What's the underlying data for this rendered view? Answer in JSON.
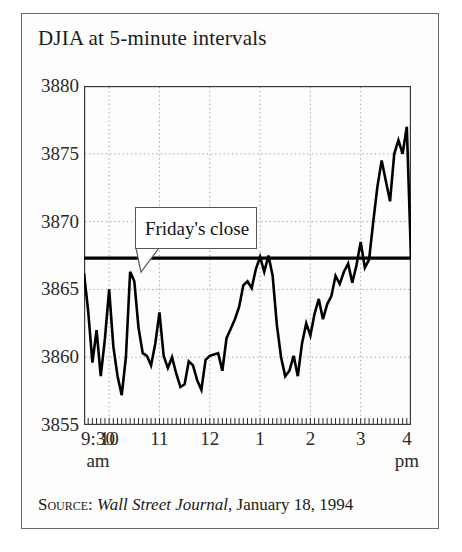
{
  "figure": {
    "title": "DJIA at 5-minute intervals",
    "source_label": "Source:",
    "source_publication": "Wall Street Journal",
    "source_date": ", January 18, 1994",
    "annotation": "Friday's close",
    "background_color": "#fdfdfb",
    "border_color": "#6b6b6b",
    "line_color": "#000000"
  },
  "chart_data": {
    "type": "line",
    "title": "DJIA at 5-minute intervals",
    "xlabel": "",
    "ylabel": "",
    "ylim": [
      3855,
      3880
    ],
    "xlim": [
      9.5,
      16.0
    ],
    "grid": true,
    "legend": "none",
    "ytick_labels": [
      "3880",
      "3875",
      "3870",
      "3865",
      "3860",
      "3855"
    ],
    "ytick_values": [
      3880,
      3875,
      3870,
      3865,
      3860,
      3855
    ],
    "xtick_labels": [
      "9:30",
      "10",
      "11",
      "12",
      "1",
      "2",
      "3",
      "4"
    ],
    "xtick_sublabels": [
      "am",
      "",
      "",
      "",
      "",
      "",
      "",
      "pm"
    ],
    "xtick_values": [
      9.5,
      10,
      11,
      12,
      13,
      14,
      15,
      16
    ],
    "reference_line": {
      "label": "Friday's close",
      "value": 3867.3
    },
    "series": [
      {
        "name": "DJIA",
        "x": [
          9.5,
          9.583,
          9.667,
          9.75,
          9.833,
          9.917,
          10.0,
          10.083,
          10.167,
          10.25,
          10.333,
          10.417,
          10.5,
          10.583,
          10.667,
          10.75,
          10.833,
          10.917,
          11.0,
          11.083,
          11.167,
          11.25,
          11.333,
          11.417,
          11.5,
          11.583,
          11.667,
          11.75,
          11.833,
          11.917,
          12.0,
          12.083,
          12.167,
          12.25,
          12.333,
          12.417,
          12.5,
          12.583,
          12.667,
          12.75,
          12.833,
          12.917,
          13.0,
          13.083,
          13.167,
          13.25,
          13.333,
          13.417,
          13.5,
          13.583,
          13.667,
          13.75,
          13.833,
          13.917,
          14.0,
          14.083,
          14.167,
          14.25,
          14.333,
          14.417,
          14.5,
          14.583,
          14.667,
          14.75,
          14.833,
          14.917,
          15.0,
          15.083,
          15.167,
          15.25,
          15.333,
          15.417,
          15.5,
          15.583,
          15.667,
          15.75,
          15.833,
          15.917,
          16.0
        ],
        "y": [
          3866.2,
          3863.4,
          3859.6,
          3862.0,
          3858.6,
          3861.4,
          3865.0,
          3860.8,
          3858.6,
          3857.2,
          3860.0,
          3866.3,
          3865.6,
          3862.2,
          3860.3,
          3860.1,
          3859.4,
          3861.0,
          3863.3,
          3860.1,
          3859.2,
          3860.0,
          3858.8,
          3857.8,
          3858.0,
          3859.7,
          3859.4,
          3858.3,
          3857.6,
          3859.8,
          3860.1,
          3860.2,
          3860.3,
          3859.0,
          3861.4,
          3862.1,
          3862.8,
          3863.7,
          3865.3,
          3865.6,
          3865.1,
          3866.5,
          3867.4,
          3866.3,
          3867.5,
          3866.0,
          3862.4,
          3860.0,
          3858.6,
          3859.0,
          3860.1,
          3858.6,
          3861.0,
          3862.5,
          3861.6,
          3863.2,
          3864.3,
          3862.8,
          3863.9,
          3864.5,
          3866.0,
          3865.4,
          3866.3,
          3866.9,
          3865.5,
          3866.8,
          3868.5,
          3866.6,
          3867.2,
          3870.0,
          3872.6,
          3874.5,
          3873.0,
          3871.5,
          3875.0,
          3876.0,
          3875.0,
          3877.0,
          3867.3
        ]
      }
    ]
  }
}
